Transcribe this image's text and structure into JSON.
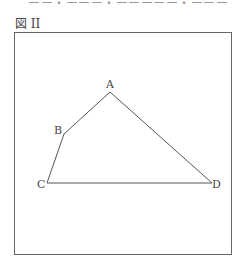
{
  "header": {
    "partial_text": "ーー・ーーー・ーーーーー・ーーー"
  },
  "figure": {
    "label": "図 II",
    "vertices": [
      {
        "name": "A",
        "x": 110,
        "y": 92,
        "label_x": 106,
        "label_y": 88
      },
      {
        "name": "B",
        "x": 64,
        "y": 134,
        "label_x": 54,
        "label_y": 134
      },
      {
        "name": "C",
        "x": 47,
        "y": 183,
        "label_x": 37,
        "label_y": 188
      },
      {
        "name": "D",
        "x": 212,
        "y": 183,
        "label_x": 212,
        "label_y": 188
      }
    ],
    "edges": [
      [
        "A",
        "B"
      ],
      [
        "B",
        "C"
      ],
      [
        "C",
        "D"
      ],
      [
        "D",
        "A"
      ]
    ]
  }
}
